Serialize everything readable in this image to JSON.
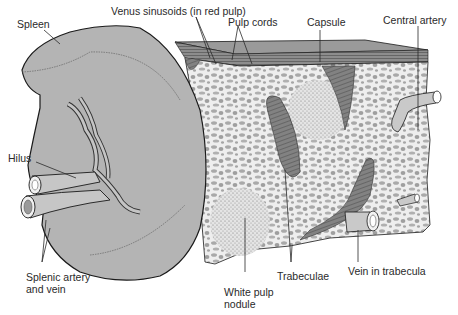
{
  "diagram": {
    "colors": {
      "organ_fill": "#b4b4b4",
      "block_fill": "#e9e9e9",
      "trabecula_fill": "#7c7c7c",
      "capsule_fill": "#8a8a8a",
      "outline": "#1a1a1a",
      "label_text": "#2a2a2a",
      "background": "#ffffff"
    },
    "labels": {
      "spleen": "Spleen",
      "venus_sinusoids": "Venus sinusoids (in red pulp)",
      "pulp_cords": "Pulp cords",
      "capsule": "Capsule",
      "central_artery": "Central artery",
      "hilus": "Hilus",
      "splenic_vessels_line1": "Splenic artery",
      "splenic_vessels_line2": "and vein",
      "white_pulp_line1": "White pulp",
      "white_pulp_line2": "nodule",
      "trabeculae": "Trabeculae",
      "vein_in_trabecula": "Vein in trabecula"
    }
  }
}
